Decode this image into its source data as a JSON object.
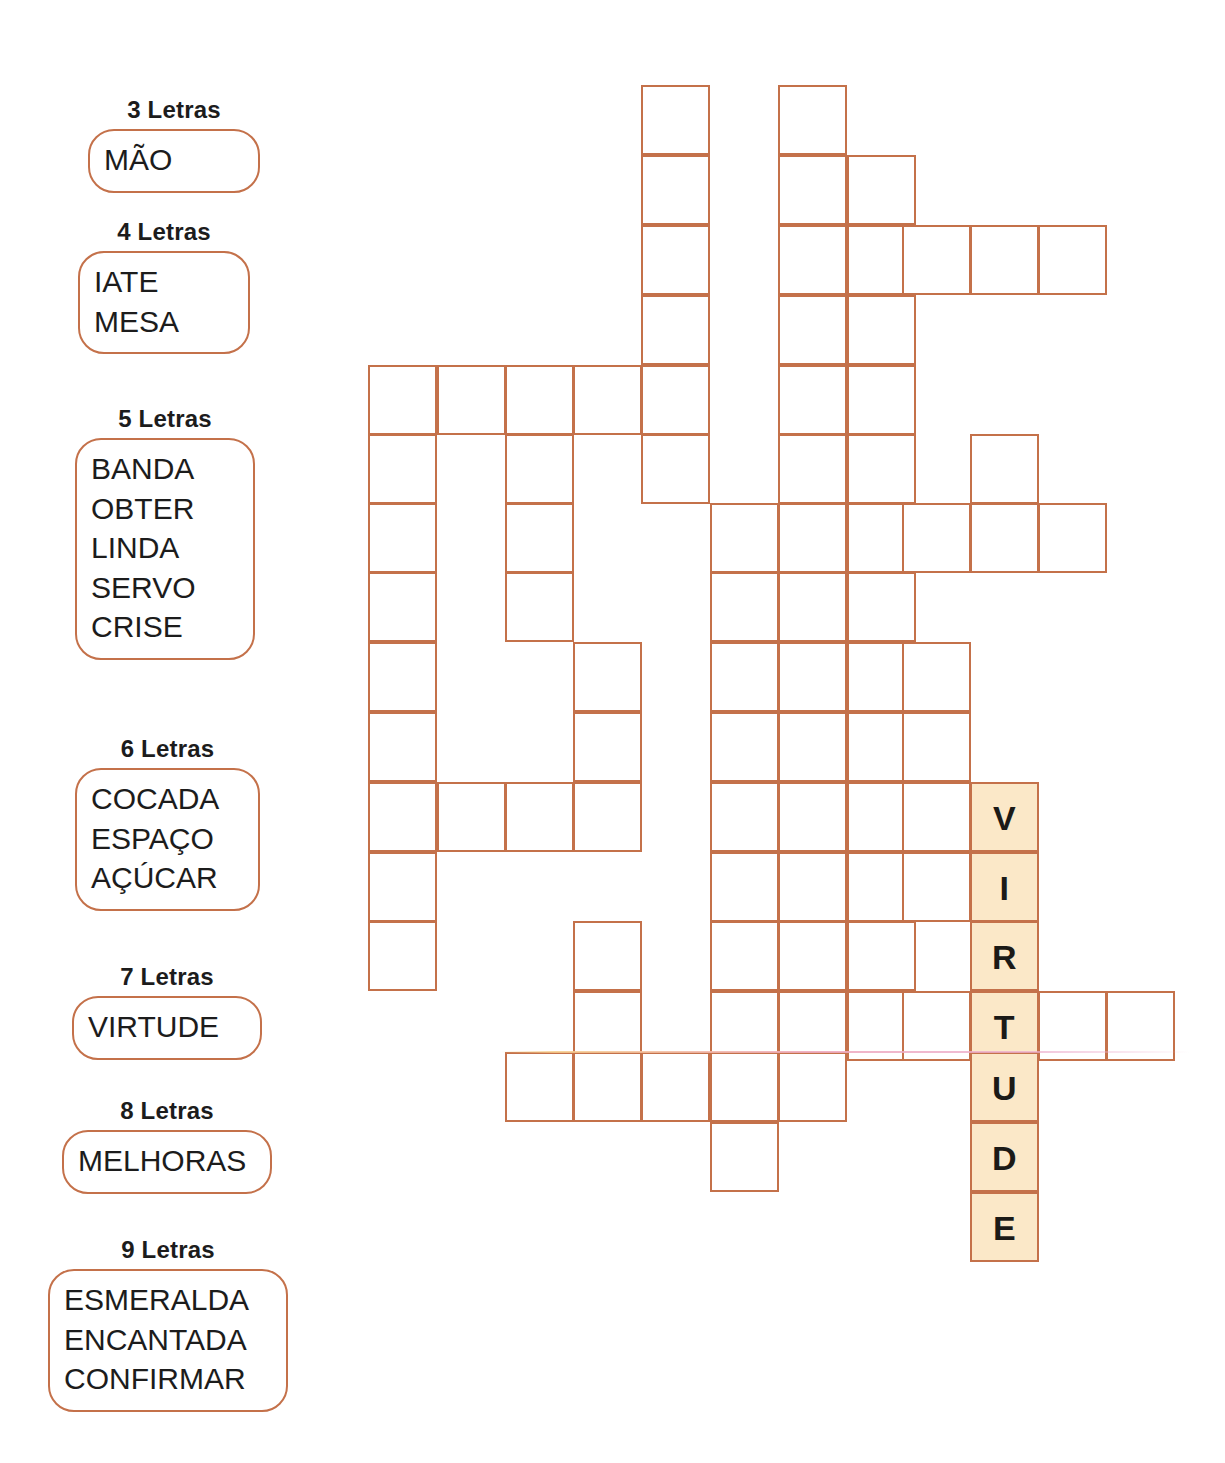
{
  "puzzle": {
    "type": "crossword-word-fill",
    "accent_color": "#c4714a",
    "filled_cell_color": "#fbe8c8",
    "text_color": "#1b1a17"
  },
  "word_bank": {
    "groups": [
      {
        "title": "3 Letras",
        "words": [
          "MÃO"
        ]
      },
      {
        "title": "4 Letras",
        "words": [
          "IATE",
          "MESA"
        ]
      },
      {
        "title": "5 Letras",
        "words": [
          "BANDA",
          "OBTER",
          "LINDA",
          "SERVO",
          "CRISE"
        ]
      },
      {
        "title": "6 Letras",
        "words": [
          "COCADA",
          "ESPAÇO",
          "AÇÚCAR"
        ]
      },
      {
        "title": "7 Letras",
        "words": [
          "VIRTUDE"
        ]
      },
      {
        "title": "8 Letras",
        "words": [
          "MELHORAS"
        ]
      },
      {
        "title": "9 Letras",
        "words": [
          "ESMERALDA",
          "ENCANTADA",
          "CONFIRMAR"
        ]
      }
    ]
  },
  "grid": {
    "origin_x": 368,
    "origin_y": 85,
    "cell_w": 68.5,
    "cell_h": 69.6,
    "cols": 12,
    "rows": 17,
    "col_x": [
      368,
      437,
      505,
      573,
      641,
      710,
      778,
      847,
      902,
      970,
      1038,
      1106
    ],
    "row_y": [
      85,
      155,
      225,
      295,
      365,
      434,
      503,
      572,
      642,
      712,
      782,
      852,
      921,
      991,
      1052,
      1122,
      1192
    ],
    "cells": [
      {
        "c": 4,
        "r": 0
      },
      {
        "c": 6,
        "r": 0
      },
      {
        "c": 4,
        "r": 1
      },
      {
        "c": 6,
        "r": 1
      },
      {
        "c": 7,
        "r": 1
      },
      {
        "c": 4,
        "r": 2
      },
      {
        "c": 6,
        "r": 2
      },
      {
        "c": 7,
        "r": 2
      },
      {
        "c": 8,
        "r": 2
      },
      {
        "c": 9,
        "r": 2
      },
      {
        "c": 10,
        "r": 2
      },
      {
        "c": 4,
        "r": 3
      },
      {
        "c": 6,
        "r": 3
      },
      {
        "c": 7,
        "r": 3
      },
      {
        "c": 0,
        "r": 4
      },
      {
        "c": 1,
        "r": 4
      },
      {
        "c": 2,
        "r": 4
      },
      {
        "c": 3,
        "r": 4
      },
      {
        "c": 4,
        "r": 4
      },
      {
        "c": 6,
        "r": 4
      },
      {
        "c": 7,
        "r": 4
      },
      {
        "c": 0,
        "r": 5
      },
      {
        "c": 2,
        "r": 5
      },
      {
        "c": 4,
        "r": 5
      },
      {
        "c": 6,
        "r": 5
      },
      {
        "c": 7,
        "r": 5
      },
      {
        "c": 9,
        "r": 5
      },
      {
        "c": 0,
        "r": 6
      },
      {
        "c": 2,
        "r": 6
      },
      {
        "c": 5,
        "r": 6
      },
      {
        "c": 6,
        "r": 6
      },
      {
        "c": 7,
        "r": 6
      },
      {
        "c": 8,
        "r": 6
      },
      {
        "c": 9,
        "r": 6
      },
      {
        "c": 10,
        "r": 6
      },
      {
        "c": 0,
        "r": 7
      },
      {
        "c": 2,
        "r": 7
      },
      {
        "c": 5,
        "r": 7
      },
      {
        "c": 6,
        "r": 7
      },
      {
        "c": 7,
        "r": 7
      },
      {
        "c": 0,
        "r": 8
      },
      {
        "c": 3,
        "r": 8
      },
      {
        "c": 5,
        "r": 8
      },
      {
        "c": 6,
        "r": 8
      },
      {
        "c": 7,
        "r": 8
      },
      {
        "c": 8,
        "r": 8
      },
      {
        "c": 0,
        "r": 9
      },
      {
        "c": 3,
        "r": 9
      },
      {
        "c": 5,
        "r": 9
      },
      {
        "c": 6,
        "r": 9
      },
      {
        "c": 7,
        "r": 9
      },
      {
        "c": 8,
        "r": 9
      },
      {
        "c": 0,
        "r": 10
      },
      {
        "c": 1,
        "r": 10
      },
      {
        "c": 2,
        "r": 10
      },
      {
        "c": 3,
        "r": 10
      },
      {
        "c": 5,
        "r": 10
      },
      {
        "c": 6,
        "r": 10
      },
      {
        "c": 7,
        "r": 10
      },
      {
        "c": 8,
        "r": 10
      },
      {
        "c": 0,
        "r": 11
      },
      {
        "c": 5,
        "r": 11
      },
      {
        "c": 6,
        "r": 11
      },
      {
        "c": 7,
        "r": 11
      },
      {
        "c": 8,
        "r": 11
      },
      {
        "c": 0,
        "r": 12
      },
      {
        "c": 3,
        "r": 12
      },
      {
        "c": 5,
        "r": 12
      },
      {
        "c": 6,
        "r": 12
      },
      {
        "c": 7,
        "r": 12
      },
      {
        "c": 3,
        "r": 13
      },
      {
        "c": 5,
        "r": 13
      },
      {
        "c": 6,
        "r": 13
      },
      {
        "c": 7,
        "r": 13
      },
      {
        "c": 8,
        "r": 13
      },
      {
        "c": 10,
        "r": 13
      },
      {
        "c": 11,
        "r": 13
      },
      {
        "c": 2,
        "r": 14
      },
      {
        "c": 3,
        "r": 14
      },
      {
        "c": 4,
        "r": 14
      },
      {
        "c": 5,
        "r": 14
      },
      {
        "c": 6,
        "r": 14
      },
      {
        "c": 5,
        "r": 15
      }
    ],
    "filled_cells": [
      {
        "c": 9,
        "r": 10,
        "letter": "V"
      },
      {
        "c": 9,
        "r": 11,
        "letter": "I"
      },
      {
        "c": 9,
        "r": 12,
        "letter": "R"
      },
      {
        "c": 9,
        "r": 13,
        "letter": "T"
      },
      {
        "c": 9,
        "r": 14,
        "letter": "U"
      },
      {
        "c": 9,
        "r": 15,
        "letter": "D"
      },
      {
        "c": 9,
        "r": 16,
        "letter": "E"
      }
    ],
    "answer_word": "VIRTUDE"
  }
}
